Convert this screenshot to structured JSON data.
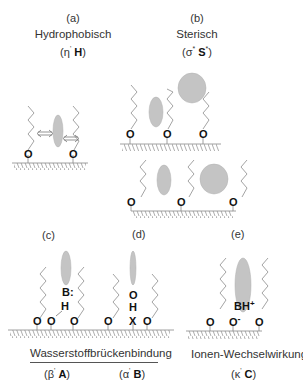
{
  "panels": {
    "a": {
      "letter": "(a)",
      "title": "Hydrophobisch",
      "param_greek": "(η",
      "param_sup": "'",
      "param_bold": "H",
      "param_close": ")"
    },
    "b": {
      "letter": "(b)",
      "title": "Sterisch",
      "param_greek": "(σ",
      "param_sup": "*",
      "param_bold": "S",
      "param_sup2": "*",
      "param_close": ")"
    },
    "c": {
      "letter": "(c)",
      "param_greek": "(β",
      "param_sup": "'",
      "param_bold": "A",
      "param_close": ")",
      "atoms": {
        "base": "B:",
        "hydrogen": "H"
      }
    },
    "d": {
      "letter": "(d)",
      "param_greek": "(α",
      "param_sup": "'",
      "param_bold": "B",
      "param_close": ")",
      "atoms": {
        "oxygen": "O",
        "hydrogen": "H",
        "acceptor": "X"
      }
    },
    "e": {
      "letter": "(e)",
      "title": "Ionen-Wechselwirkung",
      "param_greek": "(κ",
      "param_sup": "'",
      "param_bold": "C",
      "param_close": ")",
      "atoms": {
        "cation": "BH+",
        "anion": "O-"
      }
    }
  },
  "shared_caption": "Wasserstoffbrückenbindung",
  "surface_atom": "O",
  "colors": {
    "solute_fill": "#c4c4c4",
    "solute_stroke": "#aaaaaa",
    "chain": "#999999",
    "surface": "#888888",
    "text": "#222222"
  }
}
